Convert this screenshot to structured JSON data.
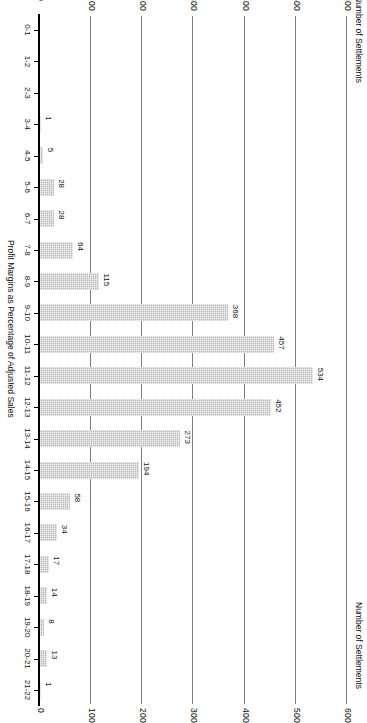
{
  "figure": {
    "y_axis_title_top": "Number of Settlements",
    "y_axis_title_bottom": "Number of Settlements",
    "x_axis_title": "Profit Margins as Percentage of Adjusted Sales"
  },
  "chart_data": {
    "type": "bar",
    "title": "",
    "xlabel": "Profit Margins as Percentage of Adjusted Sales",
    "ylabel": "Number of Settlements",
    "ylim": [
      0,
      600
    ],
    "grid": true,
    "orientation": "vertical-bars-rotated-90",
    "yticks_top": [
      600,
      500,
      400,
      300,
      200,
      100,
      0
    ],
    "yticks_bottom": [
      600,
      500,
      400,
      300,
      200,
      100,
      0
    ],
    "categories": [
      "0-1",
      "1-2",
      "2-3",
      "3-4",
      "4-5",
      "5-6",
      "6-7",
      "7-8",
      "8-9",
      "9-10",
      "10-11",
      "11-12",
      "12-13",
      "13-14",
      "14-15",
      "15-16",
      "16-17",
      "17-18",
      "18-19",
      "19-20",
      "20-21",
      "21-22"
    ],
    "values": [
      0,
      0,
      0,
      1,
      5,
      28,
      28,
      64,
      115,
      368,
      457,
      534,
      452,
      273,
      194,
      58,
      34,
      17,
      14,
      8,
      13,
      1
    ],
    "value_labels": [
      "",
      "",
      "",
      "1",
      "5",
      "28",
      "28",
      "64",
      "115",
      "368",
      "457",
      "534",
      "452",
      "273",
      "194",
      "58",
      "34",
      "17",
      "14",
      "8",
      "13",
      "1"
    ]
  }
}
